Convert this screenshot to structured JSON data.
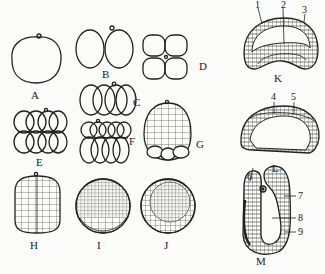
{
  "figure": {
    "stage_labels": {
      "A": "A",
      "B": "B",
      "C": "C",
      "D": "D",
      "E": "E",
      "F": "F",
      "G": "G",
      "H": "H",
      "I": "I",
      "J": "J",
      "K": "K",
      "L": "L",
      "M": "M"
    },
    "part_numbers": [
      "1",
      "2",
      "3",
      "4",
      "5",
      "6",
      "7",
      "8",
      "9"
    ],
    "colors": {
      "ink": "#222222",
      "background": "#fbfbf9"
    }
  }
}
